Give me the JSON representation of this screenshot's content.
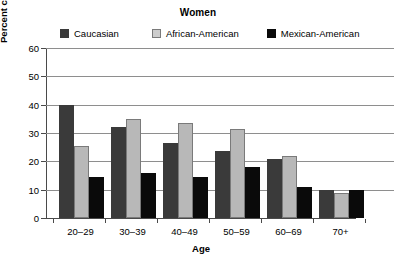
{
  "chart_data": {
    "type": "bar",
    "title": "Women",
    "xlabel": "Age",
    "ylabel": "Percent current smokers",
    "categories": [
      "20–29",
      "30–39",
      "40–49",
      "50–59",
      "60–69",
      "70+"
    ],
    "series": [
      {
        "name": "Caucasian",
        "color": "#3a3a3a",
        "values": [
          40,
          32,
          26.5,
          23.5,
          21,
          10
        ]
      },
      {
        "name": "African-American",
        "color": "#b8b8b8",
        "values": [
          25.5,
          35,
          33.5,
          31.5,
          22,
          9
        ]
      },
      {
        "name": "Mexican-American",
        "color": "#0a0a0a",
        "values": [
          14.5,
          16,
          14.5,
          18,
          11,
          10
        ]
      }
    ],
    "ylim": [
      0,
      60
    ],
    "yticks": [
      0,
      10,
      20,
      30,
      40,
      50,
      60
    ],
    "ytick_labels": [
      "0",
      "10",
      "20",
      "30",
      "40",
      "50",
      "60"
    ],
    "grid": "horizontal",
    "legend_position": "top"
  },
  "legend": {
    "items": [
      {
        "label": "Caucasian",
        "color": "#3a3a3a",
        "border": "#3a3a3a"
      },
      {
        "label": "African-American",
        "color": "#cdcdcd",
        "border": "#7a7a7a"
      },
      {
        "label": "Mexican-American",
        "color": "#0a0a0a",
        "border": "#0a0a0a"
      }
    ]
  }
}
